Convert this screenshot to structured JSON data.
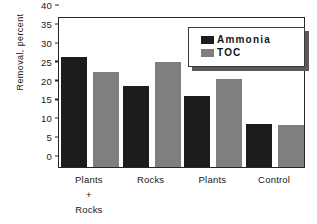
{
  "chart_data": {
    "type": "bar",
    "title": "",
    "xlabel": "",
    "ylabel": "Removal, percent",
    "ylim": [
      0,
      40
    ],
    "yticks": [
      0,
      5,
      10,
      15,
      20,
      25,
      30,
      35,
      40
    ],
    "grid": false,
    "legend_position": "top-right",
    "categories": [
      "Plants\n+\nRocks",
      "Rocks",
      "Plants",
      "Control"
    ],
    "category_lines": [
      [
        "Plants",
        "+",
        "Rocks"
      ],
      [
        "Rocks"
      ],
      [
        "Plants"
      ],
      [
        "Control"
      ]
    ],
    "series": [
      {
        "name": "Ammonia",
        "color": "#1c1c1c",
        "values": [
          29.1,
          21.5,
          18.7,
          11.5
        ]
      },
      {
        "name": "TOC",
        "color": "#7f7f7f",
        "values": [
          25.2,
          27.8,
          23.3,
          11.2
        ]
      }
    ]
  },
  "legend": {
    "entries": [
      {
        "label": "Ammonia",
        "swatch": "ammonia-swatch"
      },
      {
        "label": "TOC",
        "swatch": "toc-swatch"
      }
    ]
  },
  "axes": {
    "y_title": "Removal, percent",
    "y_tick_labels": [
      "40",
      "35",
      "30",
      "25",
      "20",
      "15",
      "10",
      "5",
      "0"
    ]
  }
}
